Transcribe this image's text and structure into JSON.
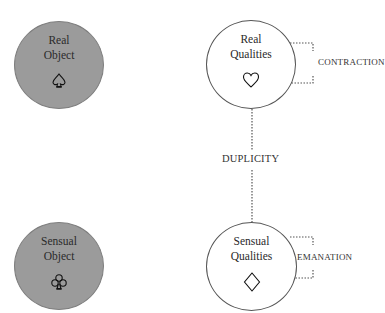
{
  "nodes": {
    "real_object": {
      "line1": "Real",
      "line2": "Object",
      "icon": "spade-outline-icon",
      "fill": "#9b9b9b"
    },
    "real_qualities": {
      "line1": "Real",
      "line2": "Qualities",
      "icon": "heart-outline-icon",
      "fill": "#ffffff"
    },
    "sensual_object": {
      "line1": "Sensual",
      "line2": "Object",
      "icon": "club-outline-icon",
      "fill": "#9b9b9b"
    },
    "sensual_qualities": {
      "line1": "Sensual",
      "line2": "Qualities",
      "icon": "diamond-outline-icon",
      "fill": "#ffffff"
    }
  },
  "relations": {
    "contraction": "CONTRACTION",
    "duplicity": "DUPLICITY",
    "emanation": "EMANATION"
  }
}
